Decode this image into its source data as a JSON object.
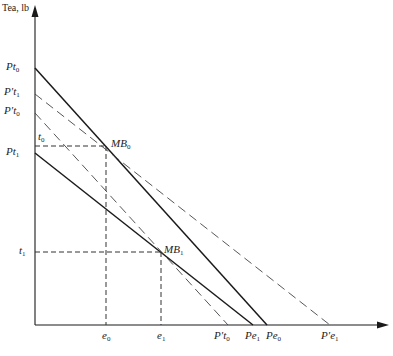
{
  "diagram": {
    "y_axis_title": "Tea, lb",
    "colors": {
      "line": "#1a1a1a",
      "dashed": "#444444",
      "background": "#ffffff"
    },
    "y_labels": [
      {
        "id": "Pt0",
        "base": "Pt",
        "sub": "0",
        "y": 68
      },
      {
        "id": "P't1",
        "base": "P′t",
        "sub": "1",
        "y": 94
      },
      {
        "id": "P't0",
        "base": "P′t",
        "sub": "0",
        "y": 113
      },
      {
        "id": "t0",
        "base": "t",
        "sub": "0",
        "y": 146
      },
      {
        "id": "Pt1",
        "base": "Pt",
        "sub": "1",
        "y": 153
      },
      {
        "id": "t1",
        "base": "t",
        "sub": "1",
        "y": 252
      }
    ],
    "x_labels": [
      {
        "id": "e0",
        "base": "e",
        "sub": "0",
        "x": 106
      },
      {
        "id": "e1",
        "base": "e",
        "sub": "1",
        "x": 161
      },
      {
        "id": "P't0x",
        "base": "P′t",
        "sub": "0",
        "x": 228
      },
      {
        "id": "Pe1",
        "base": "Pe",
        "sub": "1",
        "x": 253
      },
      {
        "id": "Pe0",
        "base": "Pe",
        "sub": "0",
        "x": 267
      },
      {
        "id": "P'e1",
        "base": "P′e",
        "sub": "1",
        "x": 330
      }
    ],
    "points": [
      {
        "id": "MB0",
        "base": "MB",
        "sub": "0",
        "x": 106,
        "y": 146
      },
      {
        "id": "MB1",
        "base": "MB",
        "sub": "1",
        "x": 161,
        "y": 252
      }
    ],
    "lines": [
      {
        "id": "budget-0",
        "style": "solid",
        "from": "Pt0",
        "to": "Pe0"
      },
      {
        "id": "budget-1",
        "style": "solid",
        "from": "Pt1",
        "to": "Pe1"
      },
      {
        "id": "price-line-t1",
        "style": "dashed",
        "from": "P't1",
        "to": "P'e1"
      },
      {
        "id": "price-line-t0",
        "style": "dashed",
        "from": "P't0",
        "to": "P't0x"
      }
    ]
  },
  "labels": {
    "Pt0": {
      "base": "Pt",
      "sub": "0"
    },
    "Pt1": {
      "base": "Pt",
      "sub": "1"
    },
    "Ppt1": {
      "base": "P′t",
      "sub": "1"
    },
    "Ppt0": {
      "base": "P′t",
      "sub": "0"
    },
    "t0": {
      "base": "t",
      "sub": "0"
    },
    "t1": {
      "base": "t",
      "sub": "1"
    },
    "MB0": {
      "base": "MB",
      "sub": "0"
    },
    "MB1": {
      "base": "MB",
      "sub": "1"
    },
    "e0": {
      "base": "e",
      "sub": "0"
    },
    "e1": {
      "base": "e",
      "sub": "1"
    },
    "Ppt0x": {
      "base": "P′t",
      "sub": "0"
    },
    "Pe1": {
      "base": "Pe",
      "sub": "1"
    },
    "Pe0": {
      "base": "Pe",
      "sub": "0"
    },
    "Ppe1": {
      "base": "P′e",
      "sub": "1"
    }
  }
}
